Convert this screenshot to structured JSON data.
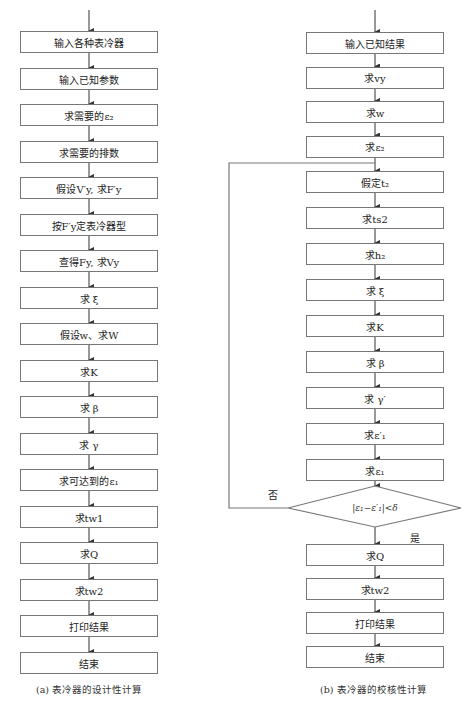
{
  "left": {
    "steps": [
      "输入各种表冷器",
      "输入已知参数",
      "求需要的ε₂",
      "求需要的排数",
      "假设V′y, 求F′y",
      "按F′y定表冷器型",
      "查得Fy, 求Vy",
      "求 ξ",
      "假设w、求W",
      "求K",
      "求 β",
      "求 γ",
      "求可达到的ε₁",
      "求tw1",
      "求Q",
      "求tw2",
      "打印结果",
      "结束"
    ],
    "caption": "(a) 表冷器的设计性计算"
  },
  "right": {
    "steps_before_loop": [
      "输入已知结果",
      "求vy",
      "求w",
      "求ε₂"
    ],
    "loop_steps": [
      "假定t₂",
      "求ts2",
      "求h₂",
      "求 ξ",
      "求K",
      "求 β",
      "求 γ′",
      "求ε′₁",
      "求ε₁"
    ],
    "decision": "|ε₁−ε′₁|<δ",
    "decision_no": "否",
    "decision_yes": "是",
    "steps_after": [
      "求Q",
      "求tw2",
      "打印结果",
      "结束"
    ],
    "caption": "(b) 表冷器的校核性计算"
  }
}
